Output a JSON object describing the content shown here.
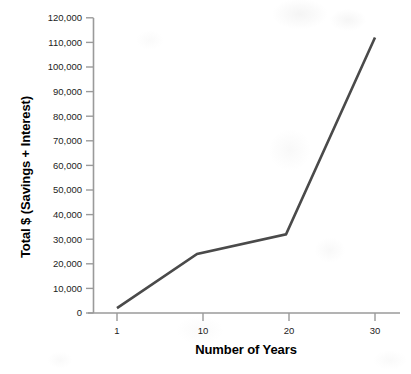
{
  "chart_data": {
    "type": "line",
    "title": "",
    "xlabel": "Number of Years",
    "ylabel": "Total $ (Savings + Interest)",
    "x": [
      1,
      10,
      20,
      30
    ],
    "values": [
      2000,
      24000,
      32000,
      112000
    ],
    "series": [
      {
        "name": "Total $ (Savings + Interest)",
        "values": [
          2000,
          24000,
          32000,
          112000
        ]
      }
    ],
    "xtick_labels": [
      "1",
      "10",
      "20",
      "30"
    ],
    "ytick_labels": [
      "0",
      "10,000",
      "20,000",
      "30,000",
      "40,000",
      "50,000",
      "60,000",
      "70,000",
      "80,000",
      "90,000",
      "100,000",
      "110,000",
      "120,000"
    ],
    "ytick_values": [
      0,
      10000,
      20000,
      30000,
      40000,
      50000,
      60000,
      70000,
      80000,
      90000,
      100000,
      110000,
      120000
    ],
    "ylim": [
      0,
      120000
    ],
    "xlim": [
      1,
      30
    ],
    "grid": false,
    "legend": false,
    "legend_position": "none",
    "line_color": "#4a4a4a",
    "axis_color": "#9a9a9a",
    "background_color": "#ffffff"
  }
}
